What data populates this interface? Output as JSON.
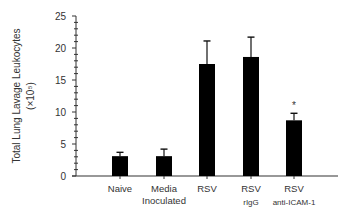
{
  "chart_data": {
    "type": "bar",
    "title": "",
    "xlabel": "",
    "ylabel": "Total Lung Lavage Leukocytes",
    "ylabel_unit": "(×10⁵)",
    "ylim": [
      0,
      25
    ],
    "yticks": [
      0,
      5,
      10,
      15,
      20,
      25
    ],
    "grid": false,
    "legend": null,
    "categories": [
      {
        "line1": "Naive",
        "line2": ""
      },
      {
        "line1": "Media",
        "line2": "Inoculated"
      },
      {
        "line1": "RSV",
        "line2": ""
      },
      {
        "line1": "RSV",
        "line2": "rIgG"
      },
      {
        "line1": "RSV",
        "line2": "anti-ICAM-1"
      }
    ],
    "values": [
      3.1,
      3.1,
      17.5,
      18.6,
      8.7
    ],
    "error_upper": [
      3.7,
      4.2,
      21.1,
      21.7,
      9.8
    ],
    "annotations": [
      {
        "category_index": 4,
        "text": "*"
      }
    ],
    "bar_color": "#000000"
  }
}
